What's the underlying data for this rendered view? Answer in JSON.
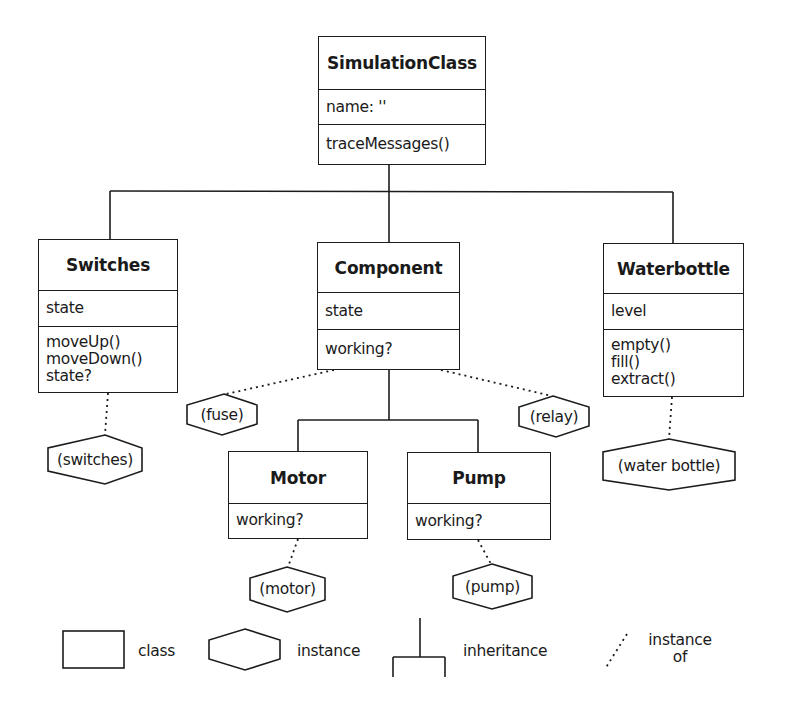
{
  "diagram": {
    "type": "class-instance hierarchy",
    "classes": [
      {
        "id": "simulation",
        "name": "SimulationClass",
        "attributes": [
          "name: ''"
        ],
        "methods": [
          "traceMessages()"
        ]
      },
      {
        "id": "switches",
        "name": "Switches",
        "attributes": [
          "state"
        ],
        "methods": [
          "moveUp()",
          "moveDown()",
          "state?"
        ]
      },
      {
        "id": "component",
        "name": "Component",
        "attributes": [
          "state"
        ],
        "methods": [
          "working?"
        ]
      },
      {
        "id": "waterbottle",
        "name": "Waterbottle",
        "attributes": [
          "level"
        ],
        "methods": [
          "empty()",
          "fill()",
          "extract()"
        ]
      },
      {
        "id": "motor",
        "name": "Motor",
        "methods": [
          "working?"
        ]
      },
      {
        "id": "pump",
        "name": "Pump",
        "methods": [
          "working?"
        ]
      }
    ],
    "instances": [
      {
        "label": "(switches)",
        "of": "Switches"
      },
      {
        "label": "(fuse)",
        "of": "Component"
      },
      {
        "label": "(relay)",
        "of": "Component"
      },
      {
        "label": "(water bottle)",
        "of": "Waterbottle"
      },
      {
        "label": "(motor)",
        "of": "Motor"
      },
      {
        "label": "(pump)",
        "of": "Pump"
      }
    ],
    "inheritance": [
      {
        "parent": "SimulationClass",
        "children": [
          "Switches",
          "Component",
          "Waterbottle"
        ]
      },
      {
        "parent": "Component",
        "children": [
          "Motor",
          "Pump"
        ]
      }
    ]
  },
  "simulation": {
    "name": "SimulationClass",
    "attr": "name: ''",
    "method": "traceMessages()"
  },
  "switches": {
    "name": "Switches",
    "attr": "state",
    "m1": "moveUp()",
    "m2": "moveDown()",
    "m3": "state?"
  },
  "component": {
    "name": "Component",
    "attr": "state",
    "method": "working?"
  },
  "waterbottle": {
    "name": "Waterbottle",
    "attr": "level",
    "m1": "empty()",
    "m2": "fill()",
    "m3": "extract()"
  },
  "motor": {
    "name": "Motor",
    "method": "working?"
  },
  "pump": {
    "name": "Pump",
    "method": "working?"
  },
  "instances": {
    "switches": "(switches)",
    "fuse": "(fuse)",
    "relay": "(relay)",
    "waterbottle": "(water bottle)",
    "motor": "(motor)",
    "pump": "(pump)"
  },
  "legend": {
    "class": "class",
    "instance": "instance",
    "inheritance": "inheritance",
    "instance_of_1": "instance",
    "instance_of_2": "of"
  }
}
